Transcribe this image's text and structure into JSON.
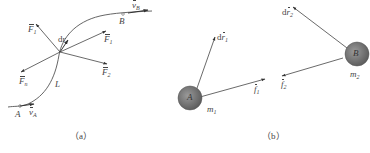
{
  "panel_a": {
    "caption": "（a）",
    "curve_label": "L",
    "point_a": "A",
    "point_b": "B",
    "velocity_a": {
      "symbol": "v",
      "sub": "A"
    },
    "velocity_b": {
      "symbol": "v",
      "sub": "B"
    },
    "displacement": "dr",
    "forces": [
      {
        "symbol": "F",
        "sub": "1",
        "position": "upper-left"
      },
      {
        "symbol": "F",
        "sub": "1",
        "position": "right"
      },
      {
        "symbol": "F",
        "sub": "2",
        "position": "lower-right"
      },
      {
        "symbol": "F",
        "sub": "n",
        "position": "lower-left"
      }
    ]
  },
  "panel_b": {
    "caption": "（b）",
    "sphere_a": {
      "label": "A",
      "mass": {
        "symbol": "m",
        "sub": "1"
      }
    },
    "sphere_b": {
      "label": "B",
      "mass": {
        "symbol": "m",
        "sub": "2"
      }
    },
    "displacement_1": {
      "prefix": "d",
      "symbol": "r",
      "sub": "1"
    },
    "displacement_2": {
      "prefix": "d",
      "symbol": "r",
      "sub": "2"
    },
    "force_1": {
      "symbol": "f",
      "sub": "1"
    },
    "force_2": {
      "symbol": "f",
      "sub": "2"
    }
  },
  "colors": {
    "line": "#555555",
    "sphere": "#7a7a7a",
    "sphere_edge": "#555555"
  }
}
